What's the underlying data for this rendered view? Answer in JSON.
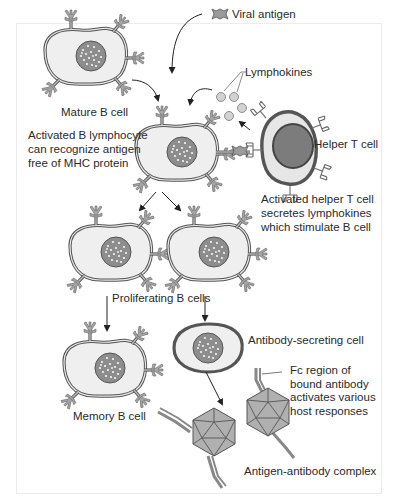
{
  "figure": {
    "title_labels": {
      "viral_antigen": "Viral antigen",
      "lymphokines": "Lymphokines",
      "mature_b_cell": "Mature B cell",
      "activated_b": [
        "Activated B lymphocyte",
        "can recognize antigen",
        "free of MHC protein"
      ],
      "helper_t_cell": "Helper T cell",
      "activated_helper_t": [
        "Activated helper T cell",
        "secretes lymphokines",
        "which stimulate B cell"
      ],
      "proliferating_b_cells": "Proliferating B cells",
      "memory_b_cell": "Memory B cell",
      "antibody_secreting_cell": "Antibody-secreting cell",
      "fc_region": [
        "Fc region of",
        "bound antibody",
        "activates various",
        "host responses"
      ],
      "antigen_antibody_complex": "Antigen-antibody complex"
    },
    "colors": {
      "cell_fill": "#eeeeee",
      "cell_stroke": "#555555",
      "nucleus_fill": "#8a8a8a",
      "helper_nucleus": "#7a7a7a",
      "receptor_fill": "#a9a9a9",
      "antigen_fill": "#9b9b9b",
      "arrow": "#222222",
      "text": "#2a2a2a"
    }
  }
}
